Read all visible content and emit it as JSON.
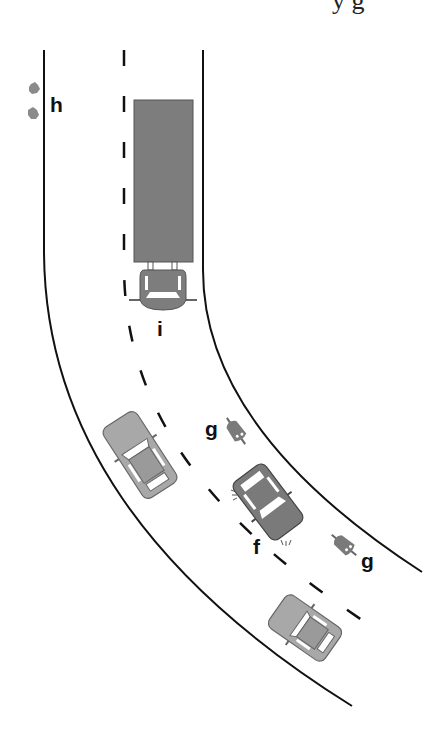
{
  "diagram": {
    "type": "road traffic scene (top-down)",
    "header_fragment": "y g",
    "colors": {
      "road_line": "#111111",
      "vehicle_dark": "#7a7a7a",
      "vehicle_light": "#a8a8a8",
      "outline": "#555555",
      "background": "#ffffff"
    },
    "labels": {
      "h": "h",
      "i": "i",
      "g_upper": "g",
      "g_lower": "g",
      "f": "f"
    },
    "elements": [
      {
        "id": "h",
        "label": "h",
        "description": "two small roadside objects outside left road edge"
      },
      {
        "id": "i",
        "label": "i",
        "description": "truck (lorry) in the right lane approaching the bend"
      },
      {
        "id": "g_upper",
        "label": "g",
        "description": "cyclist / rider near inner road edge"
      },
      {
        "id": "g_lower",
        "label": "g",
        "description": "cyclist / rider near inner road edge"
      },
      {
        "id": "f",
        "label": "f",
        "description": "car with flashing indicators in the right lane"
      },
      {
        "id": "car_left",
        "label": "",
        "description": "oncoming car in the left lane"
      },
      {
        "id": "car_bottom",
        "label": "",
        "description": "car in the right lane following behind"
      }
    ]
  }
}
